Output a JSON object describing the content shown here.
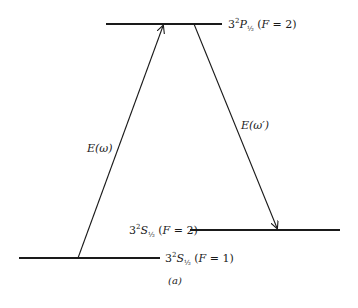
{
  "diagram": {
    "levels": [
      {
        "id": "upper",
        "prefix": "3",
        "sup": "2",
        "term": "P",
        "sub": "½",
        "suffix_open": " (",
        "F_label": "F",
        "F_value": " = 2)"
      },
      {
        "id": "middle",
        "prefix": "3",
        "sup": "2",
        "term": "S",
        "sub": "½",
        "suffix_open": " (",
        "F_label": "F",
        "F_value": " = 2)"
      },
      {
        "id": "lower",
        "prefix": "3",
        "sup": "2",
        "term": "S",
        "sub": "½",
        "suffix_open": " (",
        "F_label": "F",
        "F_value": " = 1)"
      }
    ],
    "transitions": [
      {
        "id": "pump",
        "label_E": "E",
        "label_arg": "(ω)"
      },
      {
        "id": "stokes",
        "label_E": "E",
        "label_arg": "(ω′)"
      }
    ],
    "caption": "(a)",
    "colors": {
      "line": "#1a1a1a",
      "background": "#ffffff"
    }
  }
}
